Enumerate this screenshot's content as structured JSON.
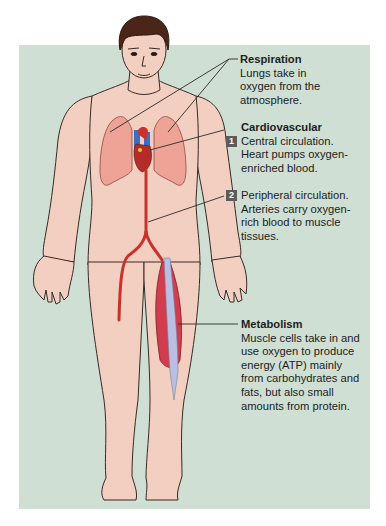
{
  "diagram": {
    "background_color": "#cfdfd3",
    "skin_color": "#f2cfc0",
    "lung_color": "#eea396",
    "artery_color": "#c8322a",
    "muscle_color": "#d23d4e",
    "tendon_color": "#b8bfe0",
    "badge_color": "#5c5c5c"
  },
  "labels": {
    "respiration": {
      "title": "Respiration",
      "lines": [
        "Lungs take in",
        "oxygen from the",
        "atmosphere."
      ]
    },
    "cardiovascular": {
      "title": "Cardiovascular",
      "items": [
        {
          "number": "1",
          "lines": [
            "Central circulation.",
            "Heart pumps oxygen-",
            "enriched blood."
          ]
        },
        {
          "number": "2",
          "lines": [
            "Peripheral circulation.",
            "Arteries carry oxygen-",
            "rich blood to muscle",
            "tissues."
          ]
        }
      ]
    },
    "metabolism": {
      "title": "Metabolism",
      "lines": [
        "Muscle cells take in and",
        "use oxygen to produce",
        "energy (ATP) mainly",
        "from carbohydrates and",
        "fats, but also small",
        "amounts from protein."
      ]
    }
  }
}
